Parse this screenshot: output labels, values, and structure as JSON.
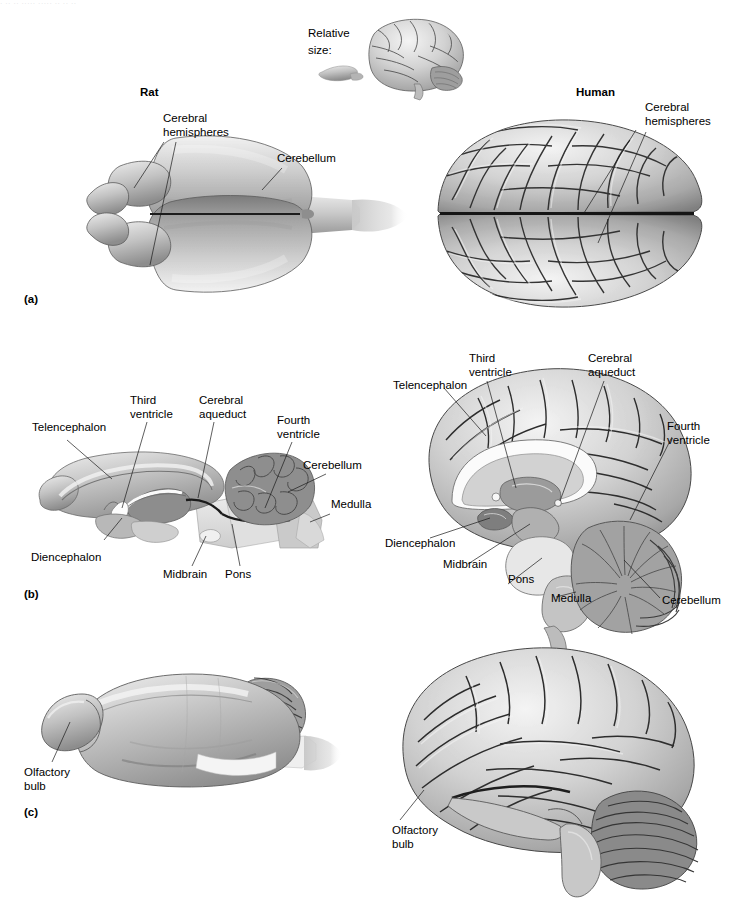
{
  "figure": {
    "top_cropped_text": "· ·· ·· ····· ····· ·· ·· ··",
    "relative_size_label": "Relative\nsize:",
    "column_headers": {
      "rat": "Rat",
      "human": "Human"
    },
    "panels": [
      {
        "id": "(a)",
        "view": "dorsal",
        "rat_labels": [
          "Cerebral\nhemispheres",
          "Cerebellum"
        ],
        "human_labels": [
          "Cerebral\nhemispheres"
        ]
      },
      {
        "id": "(b)",
        "view": "midsagittal",
        "rat_labels": [
          "Telencephalon",
          "Third\nventricle",
          "Cerebral\naqueduct",
          "Fourth\nventricle",
          "Cerebellum",
          "Medulla",
          "Diencephalon",
          "Midbrain",
          "Pons"
        ],
        "human_labels": [
          "Telencephalon",
          "Third\nventricle",
          "Cerebral\naqueduct",
          "Fourth\nventricle",
          "Diencephalon",
          "Midbrain",
          "Pons",
          "Medulla",
          "Cerebellum"
        ]
      },
      {
        "id": "(c)",
        "view": "lateral",
        "rat_labels": [
          "Olfactory\nbulb"
        ],
        "human_labels": [
          "Olfactory\nbulb"
        ]
      }
    ],
    "labels": {
      "relative_size_line1": "Relative",
      "relative_size_line2": "size:",
      "rat_header": "Rat",
      "human_header": "Human",
      "panel_a": "(a)",
      "panel_b": "(b)",
      "panel_c": "(c)",
      "cerebral_line1": "Cerebral",
      "cerebral_line2": "hemispheres",
      "cerebellum": "Cerebellum",
      "telencephalon": "Telencephalon",
      "third_line1": "Third",
      "third_line2": "ventricle",
      "aqueduct_line1": "Cerebral",
      "aqueduct_line2": "aqueduct",
      "fourth_line1": "Fourth",
      "fourth_line2": "ventricle",
      "medulla": "Medulla",
      "diencephalon": "Diencephalon",
      "midbrain": "Midbrain",
      "pons": "Pons",
      "olfactory_line1": "Olfactory",
      "olfactory_line2": "bulb"
    },
    "colors": {
      "background": "#ffffff",
      "text": "#000000",
      "leader_line": "#1a1a1a",
      "cortex_light": "#e8e8e8",
      "cortex_mid": "#b9b9b9",
      "cortex_dark": "#6f6f6f",
      "sulcus": "#2a2a2a",
      "brainstem_pale": "#dcdcdc",
      "cerebellum_gray": "#9a9a9a",
      "ventricle_white": "#fbfbfb"
    }
  }
}
